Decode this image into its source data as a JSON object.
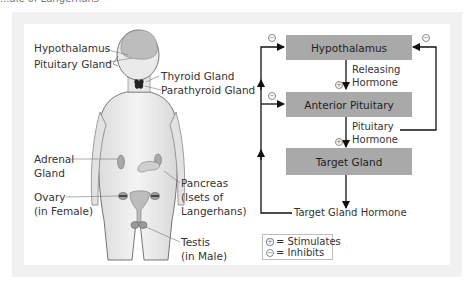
{
  "caption_fragment": "...ale of Langerhans",
  "anatomy": {
    "labels": {
      "hypothalamus": "Hypothalamus",
      "pituitary": "Pituitary Gland",
      "thyroid": "Thyroid Gland",
      "parathyroid": "Parathyroid Gland",
      "adrenal_line1": "Adrenal",
      "adrenal_line2": "Gland",
      "pancreas_line1": "Pancreas",
      "pancreas_line2": "(Isets of",
      "pancreas_line3": "Langerhans)",
      "ovary_line1": "Ovary",
      "ovary_line2": "(in Female)",
      "testis_line1": "Testis",
      "testis_line2": "(in Male)"
    }
  },
  "flowchart": {
    "boxes": {
      "hypothalamus": "Hypothalamus",
      "anterior_pituitary": "Anterior Pituitary",
      "target_gland": "Target Gland"
    },
    "arrows": {
      "releasing_line1": "Releasing",
      "releasing_line2": "Hormone",
      "pituitary_line1": "Pituitary",
      "pituitary_line2": "Hormone",
      "target_hormone": "Target Gland Hormone"
    },
    "signs": {
      "plus": "+",
      "minus": "−"
    },
    "box_color": "#a9a9a9"
  },
  "legend": {
    "stimulates": "= Stimulates",
    "inhibits": "= Inhibits",
    "plus_symbol": "+",
    "minus_symbol": "−"
  }
}
